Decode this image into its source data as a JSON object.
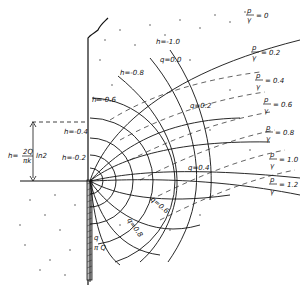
{
  "diagram": {
    "type": "flow-net",
    "head_labels": [
      {
        "text": "h=-1.0"
      },
      {
        "text": "h=-0.8"
      },
      {
        "text": "h=-0.6"
      },
      {
        "text": "h=-0.4"
      },
      {
        "text": "h=-0.2"
      }
    ],
    "flow_labels": [
      {
        "text": "q=0.0"
      },
      {
        "text": "q=0.2",
        "frac_num": "Q",
        "frac_den": "k"
      },
      {
        "text": "q=0.4",
        "frac_num": "Q",
        "frac_den": "k"
      },
      {
        "text": "q=0.6",
        "frac_num": "Q",
        "frac_den": "k"
      },
      {
        "text": "q=0.8",
        "frac_num": "Q",
        "frac_den": "π"
      },
      {
        "text": "q",
        "frac_num": "q",
        "frac_den": "π Q"
      }
    ],
    "pressure_labels": [
      {
        "num": "p",
        "den": "γ",
        "value": "= 0"
      },
      {
        "num": "p",
        "den": "γ",
        "value": "= 0.2"
      },
      {
        "num": "p",
        "den": "γ",
        "value": "= 0.4"
      },
      {
        "num": "p",
        "den": "γ",
        "value": "= 0.6"
      },
      {
        "num": "p",
        "den": "γ",
        "value": "= 0.8"
      },
      {
        "num": "p",
        "den": "γ",
        "value": "= 1.0"
      },
      {
        "num": "p",
        "den": "γ",
        "value": "= 1.2"
      }
    ],
    "dimension_label": {
      "lhs": "h=",
      "num": "2Q",
      "den": "πk",
      "suffix": "ln2"
    }
  }
}
